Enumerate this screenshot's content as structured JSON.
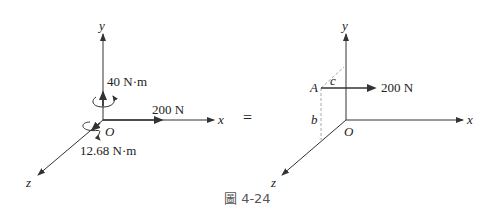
{
  "figure": {
    "caption": "圖 4-24",
    "equals_sign": "="
  },
  "left_diagram": {
    "axes": {
      "x": "x",
      "y": "y",
      "z": "z",
      "origin": "O"
    },
    "force_label": "200 N",
    "moment_y_label": "40 N·m",
    "moment_z_label": "12.68 N·m"
  },
  "right_diagram": {
    "axes": {
      "x": "x",
      "y": "y",
      "z": "z",
      "origin": "O"
    },
    "point_label": "A",
    "dim_b": "b",
    "dim_c": "c",
    "force_label": "200 N"
  },
  "colors": {
    "line": "#333333",
    "dashed": "#aaaaaa",
    "text": "#222222"
  }
}
